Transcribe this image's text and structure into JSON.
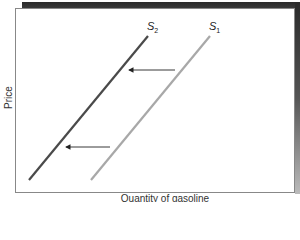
{
  "chart_data": {
    "type": "line",
    "title": "",
    "xlabel": "Quantity of gasoline",
    "ylabel": "Price",
    "grid": false,
    "legend": "none (direct labels)",
    "series": [
      {
        "name": "S1",
        "label_main": "S",
        "label_sub": "1",
        "color": "#a8a8a8",
        "points": [
          [
            91,
            180
          ],
          [
            210,
            36
          ]
        ],
        "description": "original supply curve"
      },
      {
        "name": "S2",
        "label_main": "S",
        "label_sub": "2",
        "color": "#4a4a4a",
        "points": [
          [
            29,
            180
          ],
          [
            148,
            36
          ]
        ],
        "description": "shifted supply curve (leftward)"
      }
    ],
    "annotations": [
      {
        "type": "arrow",
        "from": [
          175,
          70
        ],
        "to": [
          127,
          70
        ],
        "meaning": "supply shifts left"
      },
      {
        "type": "arrow",
        "from": [
          110,
          147
        ],
        "to": [
          64,
          147
        ],
        "meaning": "supply shifts left"
      }
    ]
  },
  "labels": {
    "s1_main": "S",
    "s1_sub": "1",
    "s2_main": "S",
    "s2_sub": "2",
    "x_axis": "Quantity of gasoline",
    "y_axis": "Price"
  }
}
